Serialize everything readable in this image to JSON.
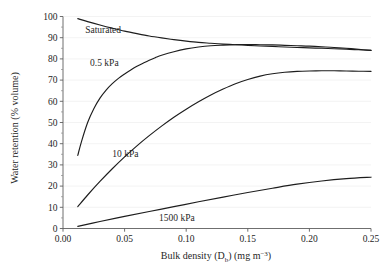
{
  "chart_data": {
    "type": "line",
    "title": "",
    "xlabel": "Bulk density (Db) (mg m-3)",
    "xlabel_parts": {
      "main": "Bulk density (D",
      "sub": "b",
      "mid": ") (mg m",
      "sup": "−3",
      "tail": ")"
    },
    "ylabel": "Water retention (% volume)",
    "xlim": [
      0.0,
      0.25
    ],
    "ylim": [
      0,
      100
    ],
    "xticks": [
      0.0,
      0.05,
      0.1,
      0.15,
      0.2,
      0.25
    ],
    "xtick_labels": [
      "0.00",
      "0.05",
      "0.10",
      "0.15",
      "0.20",
      "0.25"
    ],
    "yticks": [
      0,
      10,
      20,
      30,
      40,
      50,
      60,
      70,
      80,
      90,
      100
    ],
    "ytick_labels": [
      "0",
      "10",
      "20",
      "30",
      "40",
      "50",
      "60",
      "70",
      "80",
      "90",
      "100"
    ],
    "y_minor_ticks": [
      5,
      15,
      25,
      35,
      45,
      55,
      65,
      75,
      85,
      95
    ],
    "grid": "horizontal-faint",
    "legend_position": "inline-labels",
    "line_color": "#1d1d1d",
    "background": "#ffffff",
    "series": [
      {
        "name": "Saturated",
        "label": "Saturated",
        "label_x": 0.018,
        "label_y": 93.5,
        "x": [
          0.012,
          0.02,
          0.03,
          0.04,
          0.05,
          0.06,
          0.07,
          0.08,
          0.09,
          0.1,
          0.11,
          0.12,
          0.13,
          0.14,
          0.15,
          0.16,
          0.17,
          0.18,
          0.19,
          0.2,
          0.21,
          0.22,
          0.23,
          0.24,
          0.25
        ],
        "y": [
          99.0,
          97.6,
          96.0,
          94.5,
          93.1,
          91.9,
          90.8,
          89.9,
          89.1,
          88.4,
          87.8,
          87.4,
          87.0,
          86.7,
          86.4,
          86.1,
          85.9,
          85.6,
          85.4,
          85.2,
          85.0,
          84.8,
          84.6,
          84.3,
          84.0
        ]
      },
      {
        "name": "0.5 kPa",
        "label": "0.5 kPa",
        "label_x": 0.022,
        "label_y": 78.0,
        "x": [
          0.012,
          0.015,
          0.02,
          0.025,
          0.03,
          0.035,
          0.04,
          0.045,
          0.05,
          0.055,
          0.06,
          0.065,
          0.07,
          0.075,
          0.08,
          0.09,
          0.1,
          0.11,
          0.12,
          0.13,
          0.14,
          0.15,
          0.16,
          0.17,
          0.18,
          0.19,
          0.2,
          0.21,
          0.22,
          0.23,
          0.24,
          0.25
        ],
        "y": [
          34.5,
          41.0,
          50.0,
          56.5,
          61.5,
          65.3,
          68.3,
          70.8,
          72.9,
          74.8,
          76.5,
          78.0,
          79.4,
          80.6,
          81.7,
          83.4,
          84.7,
          85.6,
          86.2,
          86.5,
          86.7,
          86.8,
          86.7,
          86.6,
          86.4,
          86.2,
          86.0,
          85.7,
          85.4,
          85.0,
          84.5,
          84.0
        ]
      },
      {
        "name": "10 kPa",
        "label": "10 kPa",
        "label_x": 0.04,
        "label_y": 35.0,
        "x": [
          0.012,
          0.02,
          0.03,
          0.04,
          0.05,
          0.06,
          0.07,
          0.08,
          0.09,
          0.1,
          0.11,
          0.12,
          0.13,
          0.14,
          0.15,
          0.16,
          0.17,
          0.18,
          0.19,
          0.2,
          0.21,
          0.22,
          0.23,
          0.24,
          0.25
        ],
        "y": [
          10.3,
          15.8,
          22.2,
          28.2,
          33.8,
          39.0,
          43.8,
          48.3,
          52.5,
          56.3,
          59.8,
          63.0,
          65.8,
          68.3,
          70.3,
          71.9,
          73.0,
          73.7,
          74.1,
          74.3,
          74.4,
          74.4,
          74.3,
          74.2,
          74.1
        ]
      },
      {
        "name": "1500 kPa",
        "label": "1500 kPa",
        "label_x": 0.078,
        "label_y": 5.0,
        "x": [
          0.012,
          0.03,
          0.05,
          0.07,
          0.09,
          0.11,
          0.13,
          0.15,
          0.17,
          0.19,
          0.21,
          0.23,
          0.25
        ],
        "y": [
          1.0,
          3.3,
          5.7,
          8.0,
          10.3,
          12.6,
          14.8,
          17.0,
          19.0,
          20.9,
          22.4,
          23.5,
          24.2
        ]
      }
    ]
  }
}
